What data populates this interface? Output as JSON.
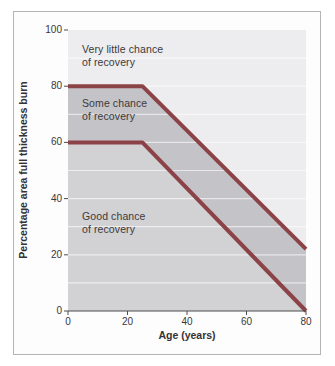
{
  "figure": {
    "background": "#fdfdfd",
    "border_color": "#b6b3b1",
    "axis_color": "#4c4c4c",
    "text_color": "#3c3a3c"
  },
  "chart_data": {
    "type": "area",
    "title": "",
    "xlabel": "Age (years)",
    "ylabel": "Percentage area full thickness burn",
    "xlim": [
      0,
      80
    ],
    "ylim": [
      0,
      100
    ],
    "x_ticks": [
      0,
      20,
      40,
      60,
      80
    ],
    "y_ticks": [
      0,
      20,
      40,
      60,
      80,
      100
    ],
    "grid": {
      "horizontal_step": 10,
      "color": "rgba(255,255,255,0.6)",
      "vertical": false
    },
    "series": [
      {
        "name": "upper-threshold",
        "x": [
          0,
          25,
          80
        ],
        "y": [
          80,
          80,
          22
        ],
        "color": "#8b4347",
        "width": 4
      },
      {
        "name": "lower-threshold",
        "x": [
          0,
          25,
          80
        ],
        "y": [
          60,
          60,
          0
        ],
        "color": "#8b4347",
        "width": 4
      }
    ],
    "zones": [
      {
        "label": "Very little chance of recovery",
        "label_lines": [
          "Very little chance",
          "of recovery"
        ],
        "fill": "#edecee",
        "polygon": [
          [
            0,
            100
          ],
          [
            80,
            100
          ],
          [
            80,
            22
          ],
          [
            25,
            80
          ],
          [
            0,
            80
          ]
        ]
      },
      {
        "label": "Some chance of recovery",
        "label_lines": [
          "Some chance",
          "of recovery"
        ],
        "fill": "#c4c3c7",
        "polygon": [
          [
            0,
            80
          ],
          [
            25,
            80
          ],
          [
            80,
            22
          ],
          [
            80,
            0
          ],
          [
            25,
            60
          ],
          [
            0,
            60
          ]
        ]
      },
      {
        "label": "Good chance of recovery",
        "label_lines": [
          "Good chance",
          "of recovery"
        ],
        "fill": "#d2d1d4",
        "polygon": [
          [
            0,
            60
          ],
          [
            25,
            60
          ],
          [
            80,
            0
          ],
          [
            0,
            0
          ]
        ]
      }
    ]
  }
}
